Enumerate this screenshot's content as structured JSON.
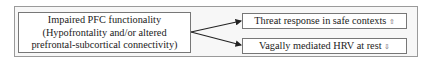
{
  "diagram": {
    "source": {
      "line1": "Impaired PFC functionality",
      "line2": "(Hypofrontality and/or altered",
      "line3": "prefrontal-subcortical connectivity)"
    },
    "targets": [
      {
        "label": "Threat response in safe contexts",
        "direction_icon": "⇧",
        "direction": "increase"
      },
      {
        "label": "Vagally mediated HRV at rest",
        "direction_icon": "⇩",
        "direction": "decrease"
      }
    ],
    "colors": {
      "border": "#777777",
      "frame": "#9a9a9a",
      "arrow": "#222222"
    }
  }
}
